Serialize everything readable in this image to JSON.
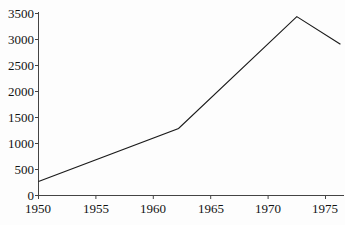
{
  "chart_data": {
    "type": "line",
    "title": "",
    "xlabel": "",
    "ylabel": "",
    "xlim": [
      1950,
      1976.3
    ],
    "ylim": [
      0,
      3500
    ],
    "grid": false,
    "legend": null,
    "xticks": [
      1950,
      1955,
      1960,
      1965,
      1970,
      1975
    ],
    "xtick_labels": [
      "1950",
      "1955",
      "1960",
      "1965",
      "1970",
      "1975"
    ],
    "yticks": [
      0,
      500,
      1000,
      1500,
      2000,
      2500,
      3000,
      3500
    ],
    "ytick_labels": [
      "0",
      "500",
      "1000",
      "1500",
      "2000",
      "2500",
      "3000",
      "3500"
    ],
    "series": [
      {
        "name": "series-1",
        "color": "#1a1a1a",
        "x": [
          1950,
          1962.2,
          1972.5,
          1976.3
        ],
        "values": [
          270,
          1290,
          3440,
          2910
        ]
      }
    ]
  },
  "axes": {
    "line_color": "#444444",
    "tick_color": "#444444",
    "data_color": "#1a1a1a",
    "background": "#fdfdfd"
  }
}
